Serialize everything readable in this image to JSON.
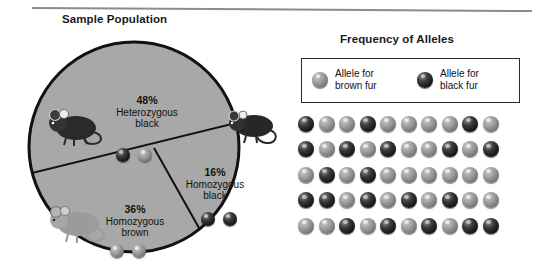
{
  "figure": {
    "left_panel_title": "Sample Population",
    "right_panel_title": "Frequency of Alleles"
  },
  "chart_data": {
    "type": "pie",
    "title": "Sample Population",
    "categories": [
      "Heterozygous black",
      "Homozygous black",
      "Homozygous brown"
    ],
    "values": [
      48,
      16,
      36
    ],
    "value_labels": [
      "48%",
      "16%",
      "36%"
    ],
    "segments": [
      {
        "percent_label": "48%",
        "line1": "Heterozygous",
        "line2": "black",
        "value": 48,
        "alleles": [
          "black",
          "brown"
        ],
        "mouse": "black-mouse"
      },
      {
        "percent_label": "16%",
        "line1": "Homozygous",
        "line2": "black",
        "value": 16,
        "alleles": [
          "black",
          "black"
        ],
        "mouse": "black-mouse"
      },
      {
        "percent_label": "36%",
        "line1": "Homozygous",
        "line2": "brown",
        "value": 36,
        "alleles": [
          "brown",
          "brown"
        ],
        "mouse": "brown-mouse"
      }
    ],
    "legend": {
      "position": "top-right",
      "entries": [
        {
          "color_name": "brown",
          "line1": "Allele for",
          "line2": "brown fur"
        },
        {
          "color_name": "black",
          "line1": "Allele for",
          "line2": "black fur"
        }
      ]
    },
    "allele_grid": {
      "title": "Frequency of Alleles",
      "rows": 5,
      "columns": 10,
      "total": 50,
      "black_count": 20,
      "brown_count": 30,
      "cells": [
        [
          "black",
          "brown",
          "brown",
          "black",
          "brown",
          "brown",
          "brown",
          "brown",
          "black",
          "brown"
        ],
        [
          "black",
          "brown",
          "black",
          "brown",
          "black",
          "brown",
          "brown",
          "black",
          "brown",
          "black"
        ],
        [
          "brown",
          "black",
          "brown",
          "black",
          "brown",
          "brown",
          "brown",
          "brown",
          "brown",
          "brown"
        ],
        [
          "black",
          "black",
          "brown",
          "black",
          "brown",
          "black",
          "brown",
          "black",
          "brown",
          "brown"
        ],
        [
          "brown",
          "brown",
          "black",
          "brown",
          "black",
          "brown",
          "black",
          "brown",
          "black",
          "black"
        ]
      ]
    },
    "colors": {
      "pie_fill": "#a8a8a8",
      "pie_outline": "#111111",
      "background": "#ffffff",
      "rule": "#8c8c8c",
      "text": "#1a1a1a"
    }
  }
}
